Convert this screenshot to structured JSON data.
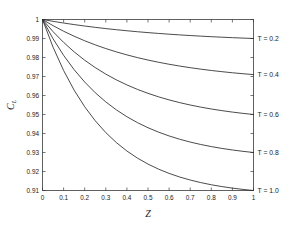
{
  "chart_data": {
    "type": "line",
    "title": "",
    "xlabel": "Z",
    "ylabel": "C",
    "ylabel_sub": "L",
    "xlim": [
      0,
      1
    ],
    "ylim": [
      0.91,
      1.0
    ],
    "grid": false,
    "legend_position": "right-inline",
    "x_ticks": [
      "0",
      "0.1",
      "0.2",
      "0.3",
      "0.4",
      "0.5",
      "0.6",
      "0.7",
      "0.8",
      "0.9",
      "1"
    ],
    "x_tick_values": [
      0,
      0.1,
      0.2,
      0.3,
      0.4,
      0.5,
      0.6,
      0.7,
      0.8,
      0.9,
      1
    ],
    "y_ticks": [
      "0.91",
      "0.92",
      "0.93",
      "0.94",
      "0.95",
      "0.96",
      "0.97",
      "0.98",
      "0.99",
      "1"
    ],
    "y_tick_values": [
      0.91,
      0.92,
      0.93,
      0.94,
      0.95,
      0.96,
      0.97,
      0.98,
      0.99,
      1.0
    ],
    "x": [
      0,
      0.05,
      0.1,
      0.15,
      0.2,
      0.25,
      0.3,
      0.35,
      0.4,
      0.45,
      0.5,
      0.55,
      0.6,
      0.65,
      0.7,
      0.75,
      0.8,
      0.85,
      0.9,
      0.95,
      1
    ],
    "series": [
      {
        "name": "T = 0.2",
        "label": "T = 0.2",
        "values": [
          1.0,
          0.9995,
          0.999,
          0.9985,
          0.998,
          0.9975,
          0.997,
          0.9965,
          0.996,
          0.9955,
          0.995,
          0.9945,
          0.994,
          0.9935,
          0.993,
          0.9925,
          0.992,
          0.9915,
          0.991,
          0.9905,
          0.99
        ]
      },
      {
        "name": "T = 0.4",
        "label": "T = 0.4",
        "values": [
          1.0,
          0.9985,
          0.997,
          0.9956,
          0.9942,
          0.9928,
          0.9915,
          0.9902,
          0.989,
          0.9878,
          0.9866,
          0.9855,
          0.9844,
          0.9833,
          0.9823,
          0.9813,
          0.9803,
          0.9794,
          0.9785,
          0.9777,
          0.971
        ]
      },
      {
        "name": "T = 0.6",
        "label": "T = 0.6",
        "values": [
          1.0,
          0.9973,
          0.9947,
          0.9923,
          0.99,
          0.9878,
          0.9857,
          0.9837,
          0.9818,
          0.98,
          0.9783,
          0.9766,
          0.975,
          0.9735,
          0.9721,
          0.9707,
          0.9694,
          0.9681,
          0.9669,
          0.9657,
          0.95
        ]
      },
      {
        "name": "T = 0.8",
        "label": "T = 0.8",
        "values": [
          1.0,
          0.9962,
          0.9925,
          0.989,
          0.9857,
          0.9825,
          0.9795,
          0.9766,
          0.9738,
          0.9712,
          0.9687,
          0.9663,
          0.964,
          0.9618,
          0.9597,
          0.9577,
          0.9558,
          0.954,
          0.9523,
          0.9506,
          0.93
        ]
      },
      {
        "name": "T = 1.0",
        "label": "T = 1.0",
        "values": [
          1.0,
          0.9948,
          0.9898,
          0.985,
          0.9804,
          0.976,
          0.9718,
          0.9678,
          0.9639,
          0.9602,
          0.9567,
          0.9533,
          0.9501,
          0.947,
          0.9441,
          0.9413,
          0.9386,
          0.9361,
          0.9337,
          0.9314,
          0.91
        ]
      }
    ],
    "series_endpoints": [
      0.99,
      0.971,
      0.95,
      0.93,
      0.91
    ]
  },
  "colors": {
    "curve": "#2b2b2b",
    "axis": "#3a3a3a",
    "text": "#1a1a1a",
    "background": "#ffffff"
  }
}
